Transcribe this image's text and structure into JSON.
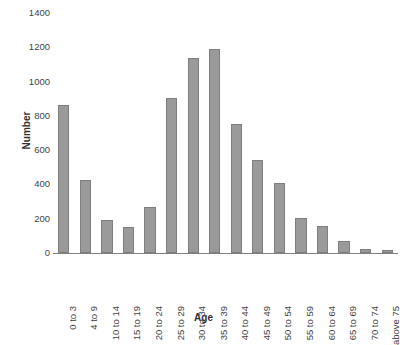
{
  "chart_data": {
    "type": "bar",
    "title": "",
    "xlabel": "Age",
    "ylabel": "Number",
    "ylim": [
      0,
      1400
    ],
    "ytick_step": 200,
    "yticks": [
      0,
      200,
      400,
      600,
      800,
      1000,
      1200,
      1400
    ],
    "ytick_labels": [
      "0",
      "200",
      "400",
      "600",
      "800",
      "1000",
      "1200",
      "1400"
    ],
    "grid": false,
    "legend": false,
    "bar_color": "#9a9a9a",
    "bar_border_color": "#7e7e7e",
    "axis_color": "#7f7f7f",
    "categories": [
      "0 to 3",
      "4 to 9",
      "10 to 14",
      "15 to 19",
      "20 to 24",
      "25 to 29",
      "30 to 34",
      "35 to 39",
      "40 to 44",
      "45 to 49",
      "50 to 54",
      "55 to 59",
      "60 to 64",
      "65 to 69",
      "70 to 74",
      "above 75"
    ],
    "values": [
      865,
      425,
      195,
      150,
      270,
      905,
      1135,
      1190,
      755,
      540,
      410,
      205,
      155,
      70,
      25,
      15
    ]
  }
}
